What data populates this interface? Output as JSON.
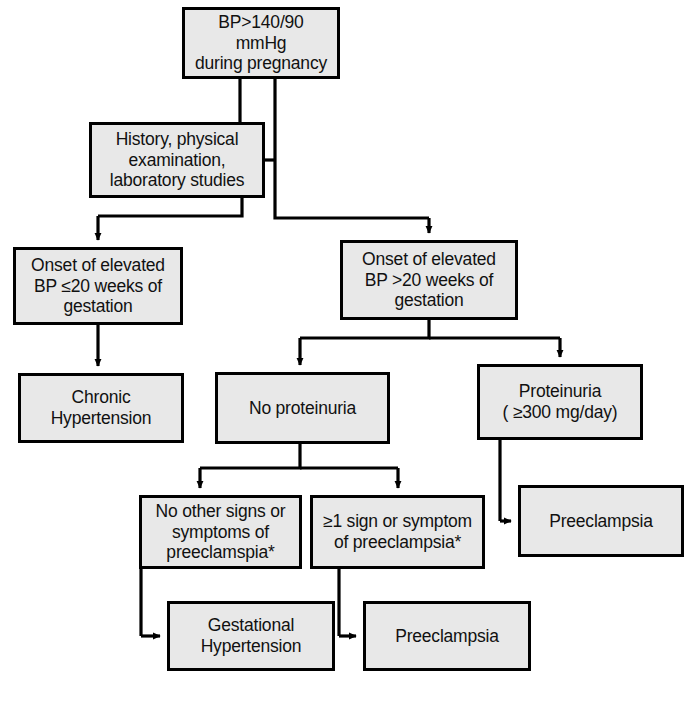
{
  "diagram": {
    "style": {
      "box_fill": "#e8e8e8",
      "box_border": "#000000",
      "connector": "#000000",
      "page_background": "#ffffff"
    },
    "nodes": [
      {
        "id": "bp-elevated",
        "name": "bp-threshold-box",
        "text": "BP>140/90 mmHg\nduring pregnancy",
        "x": 182,
        "y": 7,
        "w": 158,
        "h": 72
      },
      {
        "id": "history-workup",
        "name": "history-exam-labs-box",
        "text": "History, physical\nexamination,\nlaboratory studies",
        "x": 89,
        "y": 122,
        "w": 176,
        "h": 76
      },
      {
        "id": "onset-le20",
        "name": "onset-le-20-weeks-box",
        "text": "Onset of elevated\nBP ≤20 weeks of\ngestation",
        "x": 13,
        "y": 247,
        "w": 170,
        "h": 78
      },
      {
        "id": "onset-gt20",
        "name": "onset-gt-20-weeks-box",
        "text": "Onset of elevated\nBP >20 weeks of\ngestation",
        "x": 340,
        "y": 240,
        "w": 178,
        "h": 80
      },
      {
        "id": "chronic-htn",
        "name": "chronic-hypertension-box",
        "text": "Chronic\nHypertension",
        "x": 18,
        "y": 373,
        "w": 166,
        "h": 70
      },
      {
        "id": "no-proteinuria",
        "name": "no-proteinuria-box",
        "text": "No proteinuria",
        "x": 215,
        "y": 372,
        "w": 175,
        "h": 72
      },
      {
        "id": "proteinuria",
        "name": "proteinuria-box",
        "text": "Proteinuria\n( ≥300 mg/day)",
        "x": 477,
        "y": 364,
        "w": 166,
        "h": 76
      },
      {
        "id": "no-signs",
        "name": "no-other-signs-box",
        "text": "No other signs or\nsymptoms of\npreeclamspia*",
        "x": 139,
        "y": 495,
        "w": 163,
        "h": 74
      },
      {
        "id": "one-sign",
        "name": "one-or-more-sign-box",
        "text": "≥1 sign or symptom\nof preeclampsia*",
        "x": 310,
        "y": 495,
        "w": 175,
        "h": 74
      },
      {
        "id": "preeclampsia-right",
        "name": "preeclampsia-box-right",
        "text": "Preeclampsia",
        "x": 518,
        "y": 485,
        "w": 166,
        "h": 72
      },
      {
        "id": "gestational-htn",
        "name": "gestational-hypertension-box",
        "text": "Gestational\nHypertension",
        "x": 167,
        "y": 601,
        "w": 168,
        "h": 70
      },
      {
        "id": "preeclampsia-bottom",
        "name": "preeclampsia-box-bottom",
        "text": "Preeclampsia",
        "x": 363,
        "y": 601,
        "w": 168,
        "h": 70
      }
    ],
    "edges": [
      {
        "name": "edge-bp-to-history",
        "from": "bp-elevated",
        "to": "history-workup",
        "arrow": false
      },
      {
        "name": "edge-bp-to-onset-gt20",
        "from": "bp-elevated",
        "to": "onset-gt20",
        "arrow": true
      },
      {
        "name": "edge-history-to-onset-le20",
        "from": "history-workup",
        "to": "onset-le20",
        "arrow": true
      },
      {
        "name": "edge-onset-le20-to-chronic",
        "from": "onset-le20",
        "to": "chronic-htn",
        "arrow": true
      },
      {
        "name": "edge-onset-gt20-to-no-proteinuria",
        "from": "onset-gt20",
        "to": "no-proteinuria",
        "arrow": true
      },
      {
        "name": "edge-onset-gt20-to-proteinuria",
        "from": "onset-gt20",
        "to": "proteinuria",
        "arrow": true
      },
      {
        "name": "edge-no-proteinuria-to-no-signs",
        "from": "no-proteinuria",
        "to": "no-signs",
        "arrow": true
      },
      {
        "name": "edge-no-proteinuria-to-one-sign",
        "from": "no-proteinuria",
        "to": "one-sign",
        "arrow": true
      },
      {
        "name": "edge-proteinuria-to-preeclampsia-right",
        "from": "proteinuria",
        "to": "preeclampsia-right",
        "arrow": true
      },
      {
        "name": "edge-no-signs-to-gestational",
        "from": "no-signs",
        "to": "gestational-htn",
        "arrow": true
      },
      {
        "name": "edge-one-sign-to-preeclampsia-bottom",
        "from": "one-sign",
        "to": "preeclampsia-bottom",
        "arrow": true
      }
    ],
    "footnote_marker": "*"
  }
}
